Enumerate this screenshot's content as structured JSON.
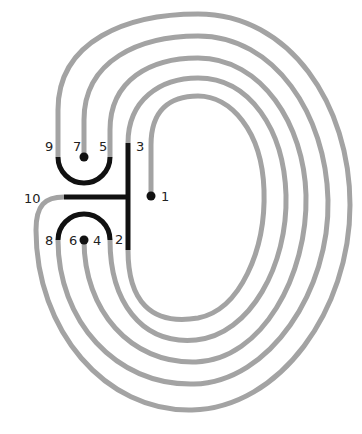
{
  "diagram": {
    "type": "labyrinth",
    "colors": {
      "path": "#a3a3a3",
      "seed": "#111111",
      "background": "#ffffff",
      "label": "#222222"
    },
    "labels": {
      "l1": "1",
      "l2": "2",
      "l3": "3",
      "l4": "4",
      "l5": "5",
      "l6": "6",
      "l7": "7",
      "l8": "8",
      "l9": "9",
      "l10": "10"
    },
    "connections": [
      {
        "from": "1",
        "to": "2"
      },
      {
        "from": "3",
        "to": "4"
      },
      {
        "from": "5",
        "to": "6"
      },
      {
        "from": "7",
        "to": "8"
      },
      {
        "from": "9",
        "to": "10"
      }
    ]
  }
}
